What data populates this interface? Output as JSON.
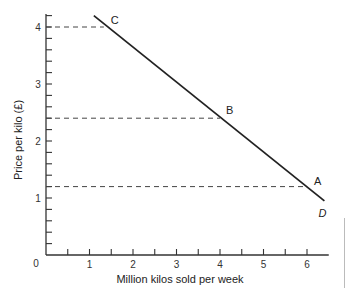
{
  "chart_data": {
    "type": "line",
    "title": "",
    "xlabel": "Million kilos sold per week",
    "ylabel": "Price per kilo (£)",
    "xlim": [
      0,
      6.5
    ],
    "ylim": [
      0,
      4.3
    ],
    "x_ticks": [
      "0",
      "1",
      "2",
      "3",
      "4",
      "5",
      "6"
    ],
    "y_ticks": [
      "1",
      "2",
      "3",
      "4"
    ],
    "x_minor_step": 0.5,
    "y_minor_step": 0.2,
    "grid": false,
    "series": [
      {
        "name": "D",
        "label": "D",
        "x": [
          1.1,
          6.4
        ],
        "y": [
          4.2,
          0.95
        ]
      }
    ],
    "points": [
      {
        "label": "C",
        "x": 1.33,
        "y": 4.0
      },
      {
        "label": "B",
        "x": 4.0,
        "y": 2.4
      },
      {
        "label": "A",
        "x": 6.0,
        "y": 1.2
      }
    ],
    "reference_lines": [
      {
        "type": "horizontal-dashed",
        "y": 4.0,
        "to_x": 1.33
      },
      {
        "type": "horizontal-dashed",
        "y": 2.4,
        "to_x": 4.0
      },
      {
        "type": "horizontal-dashed",
        "y": 1.2,
        "to_x": 6.0
      }
    ],
    "curve_label": "D",
    "colors": {
      "line": "#222222",
      "axis": "#333333",
      "dashed": "#444444"
    }
  }
}
